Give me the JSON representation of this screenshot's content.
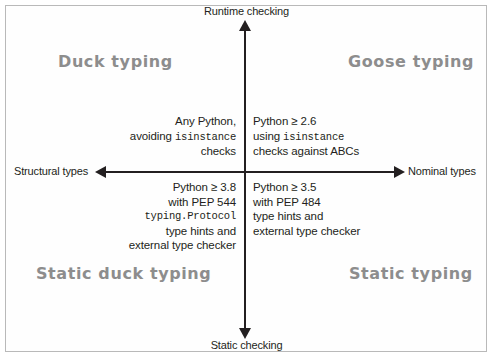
{
  "figure": {
    "type": "quadrant-diagram"
  },
  "axes": {
    "vertical": {
      "top_label": "Runtime checking",
      "bottom_label": "Static checking"
    },
    "horizontal": {
      "left_label": "Structural types",
      "right_label": "Nominal types"
    }
  },
  "quadrants": {
    "upper_left": {
      "title": "Duck typing",
      "lines": [
        {
          "text": "Any Python,",
          "mono": false
        },
        {
          "text": "avoiding ",
          "mono": false,
          "mono_tail": "isinstance"
        },
        {
          "text": "checks",
          "mono": false
        }
      ],
      "body_line1": "Any Python,",
      "body_line2_prefix": "avoiding ",
      "body_line2_mono": "isinstance",
      "body_line3": "checks"
    },
    "upper_right": {
      "title": "Goose typing",
      "body_line1": "Python ≥ 2.6",
      "body_line2_prefix": "using ",
      "body_line2_mono": "isinstance",
      "body_line3": "checks against ABCs"
    },
    "lower_left": {
      "title": "Static duck typing",
      "body_line1": "Python ≥ 3.8",
      "body_line2": "with PEP 544",
      "body_line3_mono": "typing.Protocol",
      "body_line4": "type hints and",
      "body_line5": "external type checker"
    },
    "lower_right": {
      "title": "Static typing",
      "body_line1": "Python ≥ 3.5",
      "body_line2": "with PEP 484",
      "body_line3": "type hints and",
      "body_line4": "external type checker"
    }
  },
  "colors": {
    "axis": "#231f20",
    "text": "#231f20",
    "quadrant_title": "#8d8d8d",
    "frame": "#b9b9b9",
    "background": "#ffffff"
  }
}
